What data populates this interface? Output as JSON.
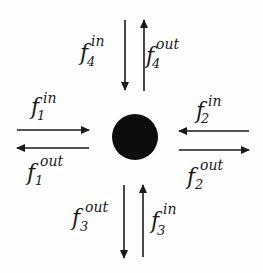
{
  "diagram": {
    "type": "node-flow-diagram",
    "node": {
      "shape": "circle",
      "fill": "#0d0d0d",
      "cx": 135,
      "cy": 137,
      "r": 23
    },
    "arrow_color": "#1a1a1a",
    "label_color": "#1a1a1a",
    "flows": [
      {
        "id": "f4_in",
        "base": "f",
        "superscript": "in",
        "subscript": "4",
        "side": "top",
        "direction": "toward-node",
        "arrow": {
          "x1": 125,
          "y1": 20,
          "x2": 125,
          "y2": 90
        },
        "label": {
          "fx": 80,
          "fy": 60,
          "supx": 91,
          "supy": 46,
          "subx": 87,
          "suby": 66
        }
      },
      {
        "id": "f4_out",
        "base": "f",
        "superscript": "out",
        "subscript": "4",
        "side": "top",
        "direction": "away-from-node",
        "arrow": {
          "x1": 144,
          "y1": 91,
          "x2": 144,
          "y2": 20
        },
        "label": {
          "fx": 146,
          "fy": 63,
          "supx": 156,
          "supy": 49,
          "subx": 152,
          "suby": 68
        }
      },
      {
        "id": "f1_in",
        "base": "f",
        "superscript": "in",
        "subscript": "1",
        "side": "left",
        "direction": "toward-node",
        "arrow": {
          "x1": 17,
          "y1": 130,
          "x2": 89,
          "y2": 130
        },
        "label": {
          "fx": 31,
          "fy": 114,
          "supx": 43,
          "supy": 103,
          "subx": 37,
          "suby": 120
        }
      },
      {
        "id": "f1_out",
        "base": "f",
        "superscript": "out",
        "subscript": "1",
        "side": "left",
        "direction": "away-from-node",
        "arrow": {
          "x1": 89,
          "y1": 148,
          "x2": 17,
          "y2": 148
        },
        "label": {
          "fx": 27,
          "fy": 180,
          "supx": 40,
          "supy": 166,
          "subx": 35,
          "suby": 185
        }
      },
      {
        "id": "f2_in",
        "base": "f",
        "superscript": "in",
        "subscript": "2",
        "side": "right",
        "direction": "toward-node",
        "arrow": {
          "x1": 249,
          "y1": 131,
          "x2": 179,
          "y2": 131
        },
        "label": {
          "fx": 196,
          "fy": 118,
          "supx": 208,
          "supy": 106,
          "subx": 201,
          "suby": 123
        }
      },
      {
        "id": "f2_out",
        "base": "f",
        "superscript": "out",
        "subscript": "2",
        "side": "right",
        "direction": "away-from-node",
        "arrow": {
          "x1": 179,
          "y1": 150,
          "x2": 249,
          "y2": 150
        },
        "label": {
          "fx": 187,
          "fy": 184,
          "supx": 200,
          "supy": 170,
          "subx": 195,
          "suby": 189
        }
      },
      {
        "id": "f3_out",
        "base": "f",
        "superscript": "out",
        "subscript": "3",
        "side": "bottom",
        "direction": "away-from-node",
        "arrow": {
          "x1": 124,
          "y1": 185,
          "x2": 124,
          "y2": 258
        },
        "label": {
          "fx": 72,
          "fy": 225,
          "supx": 85,
          "supy": 212,
          "subx": 80,
          "suby": 231
        }
      },
      {
        "id": "f3_in",
        "base": "f",
        "superscript": "in",
        "subscript": "3",
        "side": "bottom",
        "direction": "toward-node",
        "arrow": {
          "x1": 143,
          "y1": 257,
          "x2": 143,
          "y2": 185
        },
        "label": {
          "fx": 151,
          "fy": 228,
          "supx": 163,
          "supy": 214,
          "subx": 157,
          "suby": 235
        }
      }
    ]
  }
}
